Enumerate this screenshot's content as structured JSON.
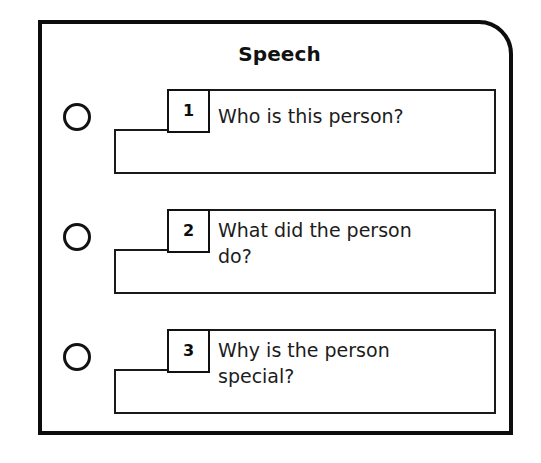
{
  "panel": {
    "title": "Speech",
    "border_color": "#0d0d0d",
    "background_color": "#ffffff"
  },
  "rows": [
    {
      "number": "1",
      "question": "Who is this person?",
      "lines": 1,
      "bubble_state": "unchecked"
    },
    {
      "number": "2",
      "question": "What did the person\ndo?",
      "lines": 2,
      "bubble_state": "unchecked"
    },
    {
      "number": "3",
      "question": "Why is the person\nspecial?",
      "lines": 2,
      "bubble_state": "unchecked"
    }
  ]
}
